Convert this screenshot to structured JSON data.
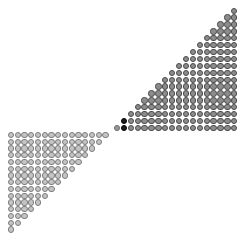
{
  "figure": {
    "width": 252,
    "height": 244,
    "background": "#ffffff"
  },
  "triangles": [
    {
      "name": "upper-right-triangle",
      "rows": 18,
      "orientation": "bottom-right-anchored",
      "origin_x": 117,
      "origin_y": 128,
      "pitch": 6.9,
      "dot_size": 6.4,
      "fill": "#8c8c8c",
      "stroke": "#4a4a4a",
      "highlight": {
        "fill": "#1e1e1e",
        "stroke": "#000000",
        "cells": [
          [
            0,
            1
          ],
          [
            1,
            1
          ]
        ]
      },
      "light_cells": {
        "fill": "#9a9a9a",
        "stroke": "#666666",
        "cells": [
          [
            0,
            0
          ]
        ]
      }
    },
    {
      "name": "lower-left-triangle",
      "rows": 15,
      "orientation": "top-left-anchored",
      "origin_x": 11,
      "origin_y": 135,
      "pitch": 6.75,
      "dot_size": 6.2,
      "fill": "#c4c4c4",
      "stroke": "#7c7c7c"
    }
  ]
}
